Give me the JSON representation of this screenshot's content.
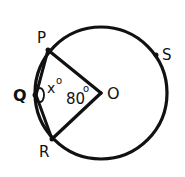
{
  "diagram": {
    "type": "circle-geometry",
    "colors": {
      "stroke": "#111111",
      "background": "#ffffff"
    },
    "circle": {
      "center_label": "O"
    },
    "points": {
      "P": {
        "label": "P"
      },
      "Q": {
        "label": "Q"
      },
      "R": {
        "label": "R"
      },
      "S": {
        "label": "S"
      },
      "O": {
        "label": "O"
      }
    },
    "angles": {
      "PQR": {
        "label": "x°"
      },
      "POR": {
        "label": "80°"
      }
    },
    "labels": {
      "P": "P",
      "Q": "Q",
      "R": "R",
      "S": "S",
      "O": "O",
      "angle_x": "x",
      "angle_80": "80",
      "degree": "o"
    }
  }
}
